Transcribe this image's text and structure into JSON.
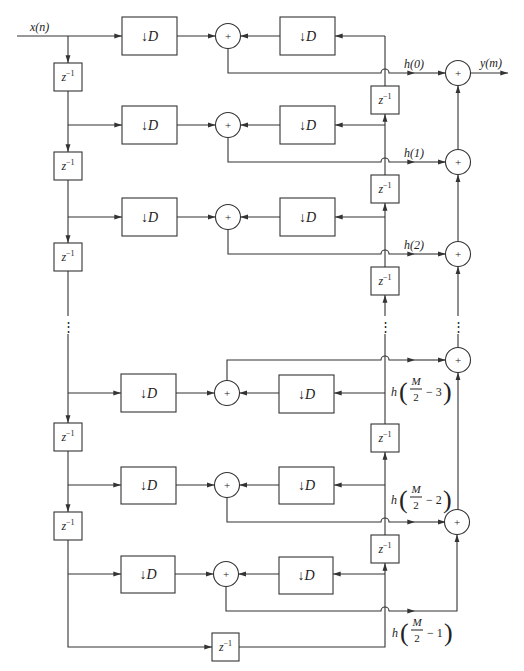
{
  "diagram": {
    "input_label": "x(n)",
    "output_label": "y(m)",
    "downsampler": {
      "arrow": "↓",
      "factor": "D"
    },
    "delay": {
      "base": "z",
      "exponent": "−1"
    },
    "adder_symbol": "+",
    "ellipsis": "⋮",
    "coefficients": [
      {
        "label": "h(0)"
      },
      {
        "label": "h(1)"
      },
      {
        "label": "h(2)"
      },
      {
        "fn": "h",
        "open": "(",
        "numerator": "M",
        "denominator": "2",
        "offset": "− 3",
        "close": ")"
      },
      {
        "fn": "h",
        "open": "(",
        "numerator": "M",
        "denominator": "2",
        "offset": "− 2",
        "close": ")"
      },
      {
        "fn": "h",
        "open": "(",
        "numerator": "M",
        "denominator": "2",
        "offset": "− 1",
        "close": ")"
      }
    ]
  }
}
